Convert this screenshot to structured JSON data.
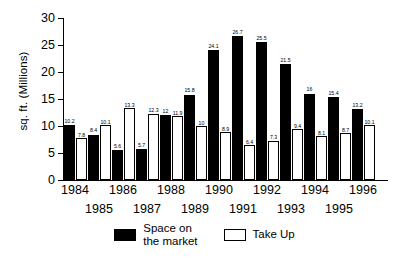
{
  "chart_data": {
    "type": "bar",
    "title": "",
    "xlabel": "",
    "ylabel": "sq. ft. (Millions)",
    "ylim": [
      0,
      30
    ],
    "yticks": [
      "0",
      "5",
      "10",
      "15",
      "20",
      "25",
      "30"
    ],
    "grid": false,
    "legend_position": "bottom-center",
    "categories": [
      "1984",
      "1985",
      "1986",
      "1987",
      "1988",
      "1989",
      "1990",
      "1991",
      "1992",
      "1993",
      "1994",
      "1995",
      "1996"
    ],
    "series": [
      {
        "name": "Space on\nthe market",
        "color": "#000000",
        "values": [
          10.2,
          8.4,
          5.6,
          5.7,
          12,
          15.8,
          24.1,
          26.7,
          25.5,
          21.5,
          16,
          15.4,
          13.2
        ],
        "labels": [
          "10.2",
          "8.4",
          "5.6",
          "5.7",
          "12",
          "15.8",
          "24.1",
          "26.7",
          "25.5",
          "21.5",
          "16",
          "15.4",
          "13.2"
        ]
      },
      {
        "name": "Take Up",
        "color": "#ffffff",
        "values": [
          7.8,
          10.1,
          13.3,
          12.3,
          11.9,
          10,
          8.9,
          6.4,
          7.3,
          9.4,
          8.1,
          8.7,
          10.1
        ],
        "labels": [
          "7.8",
          "10.1",
          "13.3",
          "12.3",
          "11.9",
          "10",
          "8.9",
          "6.4",
          "7.3",
          "9.4",
          "8.1",
          "8.7",
          "10.1"
        ]
      }
    ]
  },
  "legend": {
    "items": [
      {
        "label": "Space on\nthe market",
        "swatch": "black"
      },
      {
        "label": "Take Up",
        "swatch": "white"
      }
    ]
  }
}
